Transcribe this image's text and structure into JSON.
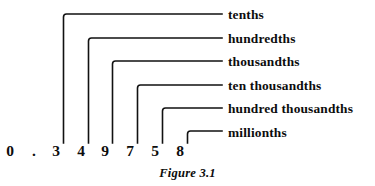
{
  "figure": {
    "caption": "Figure 3.1"
  },
  "number": {
    "digits": [
      {
        "char": "0",
        "name": "digit-ones",
        "x": 10
      },
      {
        "char": ".",
        "name": "decimal-point",
        "x": 34
      },
      {
        "char": "3",
        "name": "digit-tenths",
        "x": 56
      },
      {
        "char": "4",
        "name": "digit-hundredths",
        "x": 81
      },
      {
        "char": "9",
        "name": "digit-thousandths",
        "x": 105
      },
      {
        "char": "7",
        "name": "digit-ten-thousandths",
        "x": 130
      },
      {
        "char": "5",
        "name": "digit-hundred-thousandths",
        "x": 155
      },
      {
        "char": "8",
        "name": "digit-millionths",
        "x": 180
      }
    ]
  },
  "labels": [
    {
      "text": "tenths",
      "y": 8,
      "leader_y": 14,
      "stem_x": 63.5
    },
    {
      "text": "hundredths",
      "y": 32,
      "leader_y": 38,
      "stem_x": 88.5
    },
    {
      "text": "thousandths",
      "y": 55,
      "leader_y": 61,
      "stem_x": 112.5
    },
    {
      "text": "ten thousandths",
      "y": 79,
      "leader_y": 85,
      "stem_x": 137.5
    },
    {
      "text": "hundred thousandths",
      "y": 102,
      "leader_y": 108,
      "stem_x": 162.5
    },
    {
      "text": "millionths",
      "y": 126,
      "leader_y": 131,
      "stem_x": 187.5
    }
  ],
  "geometry": {
    "leader_end_x": 222,
    "stem_bottom_y": 143,
    "corner_radius": 3
  },
  "colors": {
    "ink": "#111111",
    "background": "#ffffff"
  }
}
